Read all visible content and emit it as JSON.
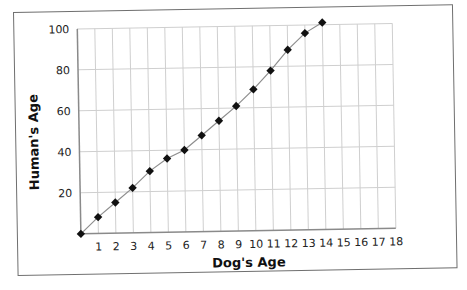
{
  "chart_data": {
    "type": "line",
    "title": "",
    "xlabel": "Dog's Age",
    "ylabel": "Human's Age",
    "xlim": [
      0,
      18
    ],
    "ylim": [
      0,
      100
    ],
    "x_ticks": [
      1,
      2,
      3,
      4,
      5,
      6,
      7,
      8,
      9,
      10,
      11,
      12,
      13,
      14,
      15,
      16,
      17,
      18
    ],
    "y_ticks": [
      20,
      40,
      60,
      80,
      100
    ],
    "grid": true,
    "legend": null,
    "marker": "diamond",
    "series": [
      {
        "name": "Human's Age",
        "x": [
          0,
          1,
          2,
          3,
          4,
          5,
          6,
          7,
          8,
          9,
          10,
          11,
          12,
          13,
          14
        ],
        "values": [
          0,
          8,
          15,
          22,
          30,
          36,
          40,
          47,
          54,
          61,
          69,
          78,
          88,
          96,
          101
        ]
      }
    ]
  },
  "colors": {
    "grid": "#cfcfcf",
    "line": "#8e8e8e",
    "marker": "#111111",
    "frame": "#6f6f6f"
  }
}
